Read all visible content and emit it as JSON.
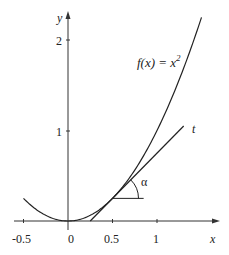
{
  "chart_data": {
    "type": "line",
    "title": "",
    "xlabel": "x",
    "ylabel": "y",
    "xlim": [
      -0.6,
      1.75
    ],
    "ylim": [
      -0.05,
      2.3
    ],
    "grid": false,
    "x_ticks": [
      -0.5,
      0,
      0.5,
      1
    ],
    "x_tick_labels": [
      "-0.5",
      "0",
      "0.5",
      "1"
    ],
    "y_ticks": [
      1,
      2
    ],
    "y_tick_labels": [
      "1",
      "2"
    ],
    "series": [
      {
        "name": "f(x) = x^2",
        "label": "f(x) = x",
        "label_sup": "2",
        "kind": "parabola",
        "x": [
          -0.5,
          -0.25,
          0,
          0.25,
          0.5,
          0.75,
          1.0,
          1.25,
          1.5
        ],
        "values": [
          0.25,
          0.0625,
          0,
          0.0625,
          0.25,
          0.5625,
          1.0,
          1.5625,
          2.25
        ]
      },
      {
        "name": "t",
        "label": "t",
        "kind": "tangent at x=0.5",
        "equation": "y = x - 0.25",
        "x": [
          0.25,
          1.3
        ],
        "values": [
          0,
          1.05
        ]
      }
    ],
    "annotations": [
      {
        "type": "angle",
        "label": "α",
        "vertex": [
          0.5,
          0.25
        ],
        "horizontal_to_x": 0.85
      }
    ]
  },
  "labels": {
    "x_axis": "x",
    "y_axis": "y",
    "func_main": "f(x) = x",
    "func_sup": "2",
    "tangent": "t",
    "angle": "α",
    "tick_x_m05": "-0.5",
    "tick_x_0": "0",
    "tick_x_05": "0.5",
    "tick_x_1": "1",
    "tick_y_1": "1",
    "tick_y_2": "2"
  },
  "colors": {
    "ink": "#222222",
    "background": "#ffffff"
  }
}
